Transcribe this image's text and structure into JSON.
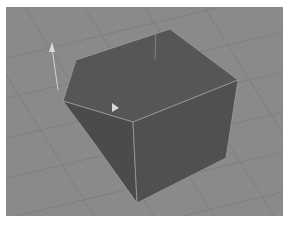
{
  "viewport": {
    "background": "#8a8a8a",
    "grid_color": "#7a7a7a",
    "object": "cube",
    "cube_colors": {
      "top": "#555555",
      "left": "#4a4a4a",
      "right": "#4f4f4f",
      "edge": "#9a9a9a"
    },
    "gizmo_color": "#d8d8d8"
  }
}
